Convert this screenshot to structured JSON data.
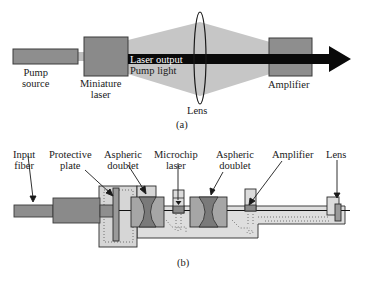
{
  "figure": {
    "panel_a": {
      "caption": "(a)",
      "labels": {
        "pump_source": [
          "Pump",
          "source"
        ],
        "miniature_laser": [
          "Miniature",
          "laser"
        ],
        "laser_output": "Laser output",
        "pump_light": "Pump light",
        "lens": "Lens",
        "amplifier": "Amplifier"
      }
    },
    "panel_b": {
      "caption": "(b)",
      "labels": {
        "input_fiber": [
          "Input",
          "fiber"
        ],
        "protective_plate": [
          "Protective",
          "plate"
        ],
        "aspheric_doublet_1": [
          "Aspheric",
          "doublet"
        ],
        "microchip_laser": [
          "Microchip",
          "laser"
        ],
        "aspheric_doublet_2": [
          "Aspheric",
          "doublet"
        ],
        "amplifier": "Amplifier",
        "lens": "Lens"
      }
    },
    "colors": {
      "component_fill": "#8c8c8c",
      "component_stroke": "#3a3a3a",
      "cone_fill": "#c4c4c4",
      "beam": "#0a0a0a",
      "housing_fill": "#dcdcdc",
      "doublet_dark": "#7a7a7a"
    }
  }
}
